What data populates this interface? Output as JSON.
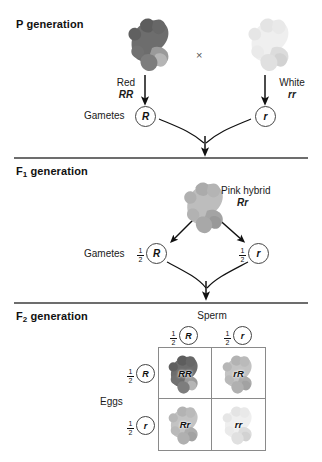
{
  "figure": {
    "type": "genetics-cross-diagram"
  },
  "sections": [
    {
      "id": "p",
      "label": "P generation",
      "sub": ""
    },
    {
      "id": "f1",
      "label": "F",
      "sub": "1",
      "suffix": " generation"
    },
    {
      "id": "f2",
      "label": "F",
      "sub": "2",
      "suffix": " generation"
    }
  ],
  "p_generation": {
    "title_main": "P",
    "title_suffix": " generation",
    "cross_symbol": "×",
    "parent_left": {
      "phenotype": "Red",
      "genotype": "RR",
      "color_name": "dark-red-gray",
      "flower_color": "#6b6b6b"
    },
    "parent_right": {
      "phenotype": "White",
      "genotype": "rr",
      "color_name": "white-gray",
      "flower_color": "#ededed"
    },
    "gametes_label": "Gametes",
    "gamete_left": "R",
    "gamete_right": "r"
  },
  "f1_generation": {
    "title_main": "F",
    "title_sub": "1",
    "title_suffix": " generation",
    "hybrid": {
      "phenotype": "Pink hybrid",
      "genotype": "Rr",
      "flower_color": "#b0b0b0"
    },
    "gametes_label": "Gametes",
    "gamete_left": {
      "fraction_num": "1",
      "fraction_den": "2",
      "allele": "R"
    },
    "gamete_right": {
      "fraction_num": "1",
      "fraction_den": "2",
      "allele": "r"
    }
  },
  "f2_generation": {
    "title_main": "F",
    "title_sub": "2",
    "title_suffix": " generation",
    "sperm_label": "Sperm",
    "eggs_label": "Eggs",
    "columns": [
      {
        "fraction_num": "1",
        "fraction_den": "2",
        "allele": "R"
      },
      {
        "fraction_num": "1",
        "fraction_den": "2",
        "allele": "r"
      }
    ],
    "rows": [
      {
        "fraction_num": "1",
        "fraction_den": "2",
        "allele": "R"
      },
      {
        "fraction_num": "1",
        "fraction_den": "2",
        "allele": "r"
      }
    ],
    "cells": [
      {
        "genotype": "RR",
        "phenotype": "red",
        "flower_color": "#6b6b6b"
      },
      {
        "genotype": "rR",
        "phenotype": "pink",
        "flower_color": "#b3b3b3"
      },
      {
        "genotype": "Rr",
        "phenotype": "pink",
        "flower_color": "#b3b3b3"
      },
      {
        "genotype": "rr",
        "phenotype": "white",
        "flower_color": "#ededed"
      }
    ]
  },
  "icons": {
    "flower": "snapdragon-flower-icon",
    "arrow_down": "arrow-down-icon",
    "arrow_converge": "converging-arrow-icon",
    "arrow_diverge": "diverging-arrow-icon"
  },
  "colors": {
    "divider": "#6d6d6d",
    "grid_border": "#8a8a8a",
    "text": "#1a1a1a",
    "circle_stroke": "#444444"
  }
}
